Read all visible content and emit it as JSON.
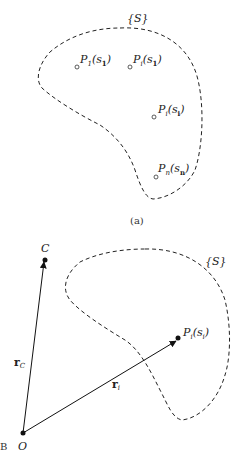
{
  "panel_a": {
    "set_label": "{S}",
    "caption": "(a)",
    "points": [
      {
        "name": "P",
        "sub": "1",
        "arg": "s",
        "arg_sub": "1",
        "x": 77,
        "y": 67
      },
      {
        "name": "P",
        "sub": "i",
        "arg": "s",
        "arg_sub": "1",
        "x": 130,
        "y": 67
      },
      {
        "name": "P",
        "sub": "i",
        "arg": "s",
        "arg_sub": "i",
        "x": 154,
        "y": 117
      },
      {
        "name": "P",
        "sub": "n",
        "arg": "s",
        "arg_sub": "n",
        "x": 156,
        "y": 177
      }
    ]
  },
  "panel_b": {
    "set_label": "{S}",
    "origin_label": "O",
    "center_label": "C",
    "point_label": "P",
    "point_sub": "i",
    "point_arg": "s",
    "point_arg_sub": "i",
    "vector_c_label": "r",
    "vector_c_sub": "C",
    "vector_i_label": "r",
    "vector_i_sub": "i",
    "side_mark": "B"
  }
}
